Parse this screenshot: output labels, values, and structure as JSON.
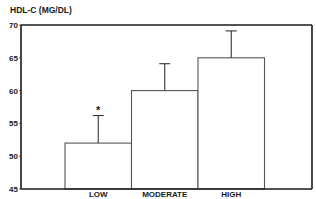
{
  "chart_data": {
    "type": "bar",
    "title": "",
    "xlabel": "",
    "ylabel": "HDL-C (MG/DL)",
    "ylim": [
      45,
      70
    ],
    "yticks": [
      45,
      50,
      55,
      60,
      65,
      70
    ],
    "ytick_labels": [
      "45",
      "50",
      "55",
      "60",
      "65",
      "70"
    ],
    "categories": [
      "LOW",
      "MODERATE",
      "HIGH"
    ],
    "values": [
      52,
      60,
      65
    ],
    "error_upper": [
      56.2,
      64.1,
      69.1
    ],
    "annotations": [
      {
        "category": "LOW",
        "text": "*"
      }
    ],
    "grid": false,
    "legend": "none",
    "colors": {
      "bar_fill": "#ffffff",
      "bar_stroke": "#555555",
      "axis": "#1a1a1a"
    }
  }
}
